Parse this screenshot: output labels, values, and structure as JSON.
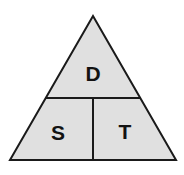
{
  "diagram": {
    "name": "distance-speed-time-triangle",
    "shape": "triangle",
    "colors": {
      "background": "#ffffff",
      "fill": "#e0e0e0",
      "stroke": "#1a1a1a",
      "text": "#121212"
    },
    "geometry": {
      "apex": [
        93,
        16
      ],
      "bottom_left": [
        10,
        160
      ],
      "bottom_right": [
        176,
        160
      ],
      "horizontal_divider_y": 98,
      "horizontal_divider_x1": 45,
      "horizontal_divider_x2": 141,
      "vertical_divider_x": 93,
      "vertical_divider_y1": 98,
      "vertical_divider_y2": 160,
      "stroke_width": 2
    },
    "cells": {
      "top": {
        "label": "D",
        "meaning": "distance"
      },
      "bottom_left": {
        "label": "S",
        "meaning": "speed"
      },
      "bottom_right": {
        "label": "T",
        "meaning": "time"
      }
    }
  }
}
